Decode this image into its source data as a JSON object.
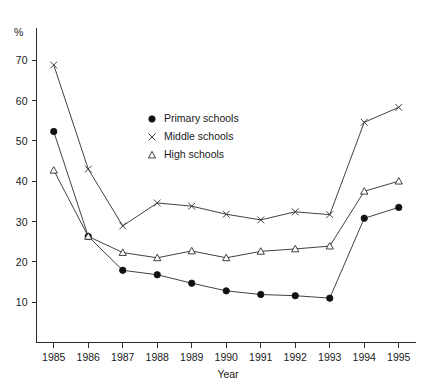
{
  "chart_data": {
    "type": "line",
    "title": "",
    "xlabel": "Year",
    "ylabel": "",
    "unit_label": "%",
    "categories": [
      "1985",
      "1986",
      "1987",
      "1988",
      "1989",
      "1990",
      "1991",
      "1992",
      "1993",
      "1994",
      "1995"
    ],
    "x": [
      1985,
      1986,
      1987,
      1988,
      1989,
      1990,
      1991,
      1992,
      1993,
      1994,
      1995
    ],
    "xlim": [
      1984.5,
      1995.5
    ],
    "ylim": [
      0,
      75
    ],
    "yticks": [
      10,
      20,
      30,
      40,
      50,
      60,
      70
    ],
    "ytick_labels": [
      "10",
      "20",
      "30",
      "40",
      "50",
      "60",
      "70"
    ],
    "grid": false,
    "legend_position": "upper-center",
    "series": [
      {
        "name": "Primary schools",
        "marker": "filled-circle",
        "values": [
          52.3,
          26.3,
          17.9,
          16.8,
          14.7,
          12.8,
          11.9,
          11.6,
          11.0,
          30.8,
          33.5
        ]
      },
      {
        "name": "Middle schools",
        "marker": "cross",
        "values": [
          68.8,
          43.0,
          28.9,
          34.6,
          33.8,
          31.8,
          30.4,
          32.4,
          31.7,
          54.6,
          58.3
        ]
      },
      {
        "name": "High schools",
        "marker": "open-triangle",
        "values": [
          42.7,
          26.3,
          22.3,
          21.0,
          22.7,
          21.0,
          22.6,
          23.2,
          23.9,
          37.5,
          40.0
        ]
      }
    ]
  },
  "legend": {
    "items": [
      {
        "label": "Primary schools",
        "marker": "filled-circle"
      },
      {
        "label": "Middle schools",
        "marker": "cross"
      },
      {
        "label": "High schools",
        "marker": "open-triangle"
      }
    ]
  },
  "axes": {
    "x_title": "Year",
    "y_unit": "%"
  }
}
